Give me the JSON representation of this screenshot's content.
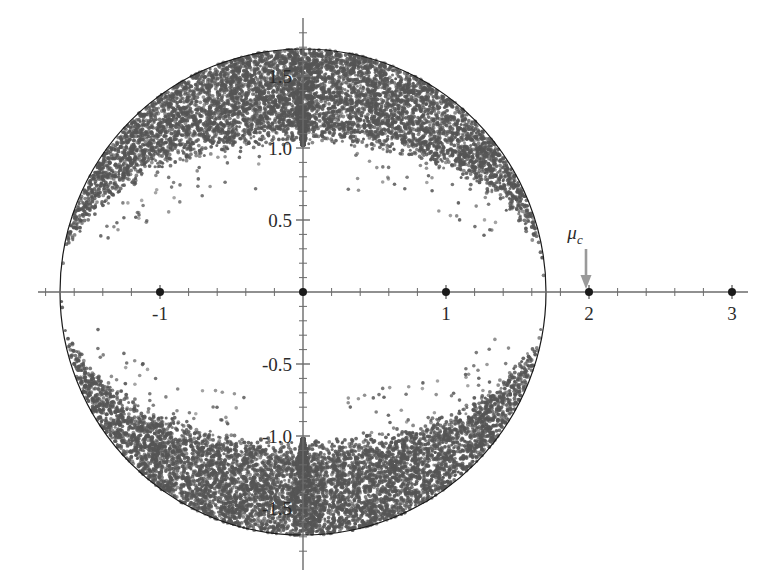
{
  "chart_data": {
    "type": "scatter",
    "title": "",
    "subtitle": "",
    "xlabel": "",
    "ylabel": "",
    "xlim": [
      -1.85,
      3.3
    ],
    "ylim": [
      -1.78,
      1.78
    ],
    "grid": false,
    "legend_position": "none",
    "x_ticks_major": [
      -1,
      1,
      2,
      3
    ],
    "x_tick_labels": [
      "-1",
      "1",
      "2",
      "3"
    ],
    "x_ticks_minor_step": 0.2,
    "y_ticks_major": [
      -1.5,
      -1.0,
      -0.5,
      0.5,
      1.0,
      1.5
    ],
    "y_tick_labels": [
      "-1.5",
      "-1.0",
      "-0.5",
      "0.5",
      "1.0",
      "1.5"
    ],
    "y_ticks_minor_step": 0.1,
    "origin_x": 0,
    "origin_y": 0,
    "bulk_description": "dense point cloud filling a disk of radius 1.69 centered at origin, with an empty lens-shaped void straddling the real axis",
    "bulk_outer_radius": 1.69,
    "bulk_point_count": 12000,
    "void_half_height": 1.02,
    "spike_positions": [
      [
        0,
        1.0
      ],
      [
        0,
        -1.0
      ]
    ],
    "outlier_points": [
      {
        "x": -1,
        "y": 0,
        "label": ""
      },
      {
        "x": 0,
        "y": 0,
        "label": ""
      },
      {
        "x": 1,
        "y": 0,
        "label": ""
      },
      {
        "x": 2,
        "y": 0,
        "label": "mu_c"
      },
      {
        "x": 3,
        "y": 0,
        "label": ""
      }
    ],
    "annotations": [
      {
        "name": "mu-c-annotation",
        "text": "μ",
        "subscript": "c",
        "target_x": 2,
        "target_y": 0,
        "arrow": "down-arrow",
        "arrow_color": "#9a9a9a"
      }
    ],
    "series": [
      {
        "name": "bulk-eigenvalues",
        "marker": "dot",
        "color": "#555555",
        "size": 2.0
      },
      {
        "name": "outlier-eigenvalues",
        "marker": "dot",
        "color": "#1a1a1a",
        "size": 4.0
      }
    ],
    "boundary_circle": {
      "name": "spectral-boundary",
      "radius": 1.69,
      "color": "#1a1a1a",
      "stroke_width": 1.2
    }
  },
  "axes": {
    "axis_color": "#6b6b6b",
    "tick_color": "#6b6b6b",
    "real_axis_name": "real-axis",
    "imaginary_axis_name": "imaginary-axis"
  },
  "colors": {
    "background": "#ffffff",
    "bulk_points": "#555555",
    "outliers": "#1a1a1a",
    "boundary": "#1a1a1a",
    "axis": "#6b6b6b",
    "arrow": "#9a9a9a",
    "text": "#2b2b2b"
  },
  "labels": {
    "x_neg1": "-1",
    "x_1": "1",
    "x_2": "2",
    "x_3": "3",
    "y_pos05": "0.5",
    "y_pos10": "1.0",
    "y_pos15": "1.5",
    "y_neg05": "-0.5",
    "y_neg10": "-1.0",
    "y_neg15": "-1.5",
    "mu": "μ",
    "mu_sub": "c"
  }
}
